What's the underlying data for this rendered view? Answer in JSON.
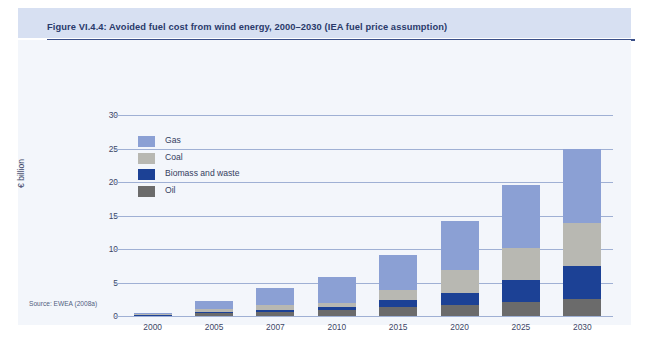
{
  "figure": {
    "title": "Figure VI.4.4: Avoided fuel cost from wind energy, 2000–2030 (IEA fuel price assumption)",
    "source": "Source: EWEA (2008a)"
  },
  "colors": {
    "gas": "#8ba0d4",
    "coal": "#b8b8b2",
    "biomass": "#1c4195",
    "oil": "#6b6b6b",
    "grid": "#9fb0d4",
    "panel_background": "#f3f6fb",
    "title_band": "#d7e0f2",
    "title_rule": "#3b4f88",
    "title_text": "#2a3a6b",
    "axis_text": "#3b4668"
  },
  "chart_data": {
    "type": "bar",
    "stacked": true,
    "title": "Figure VI.4.4: Avoided fuel cost from wind energy, 2000–2030 (IEA fuel price assumption)",
    "xlabel": "",
    "ylabel": "€ billion",
    "ylim": [
      0,
      30
    ],
    "yticks": [
      0,
      5,
      10,
      15,
      20,
      25,
      30
    ],
    "ytick_labels": [
      "0",
      "5",
      "10",
      "15",
      "20",
      "25",
      "30"
    ],
    "grid": true,
    "legend_position": "inside-top-left",
    "categories": [
      "2000",
      "2005",
      "2007",
      "2010",
      "2015",
      "2020",
      "2025",
      "2030"
    ],
    "series": [
      {
        "name": "Oil",
        "color": "#6b6b6b",
        "values": [
          0.1,
          0.4,
          0.6,
          0.9,
          1.3,
          1.6,
          2.1,
          2.6
        ]
      },
      {
        "name": "Biomass and waste",
        "color": "#1c4195",
        "values": [
          0.05,
          0.2,
          0.3,
          0.4,
          1.1,
          1.9,
          3.3,
          4.9
        ]
      },
      {
        "name": "Coal",
        "color": "#b8b8b2",
        "values": [
          0.15,
          0.5,
          0.7,
          0.7,
          1.5,
          3.4,
          4.8,
          6.4
        ]
      },
      {
        "name": "Gas",
        "color": "#8ba0d4",
        "values": [
          0.1,
          1.1,
          2.6,
          3.8,
          5.2,
          7.3,
          9.3,
          11.1
        ]
      }
    ],
    "totals": [
      0.4,
      2.2,
      4.2,
      5.8,
      9.1,
      14.2,
      19.5,
      25.0
    ]
  },
  "legend": {
    "items": [
      {
        "label": "Gas",
        "color": "#8ba0d4"
      },
      {
        "label": "Coal",
        "color": "#b8b8b2"
      },
      {
        "label": "Biomass and waste",
        "color": "#1c4195"
      },
      {
        "label": "Oil",
        "color": "#6b6b6b"
      }
    ]
  }
}
